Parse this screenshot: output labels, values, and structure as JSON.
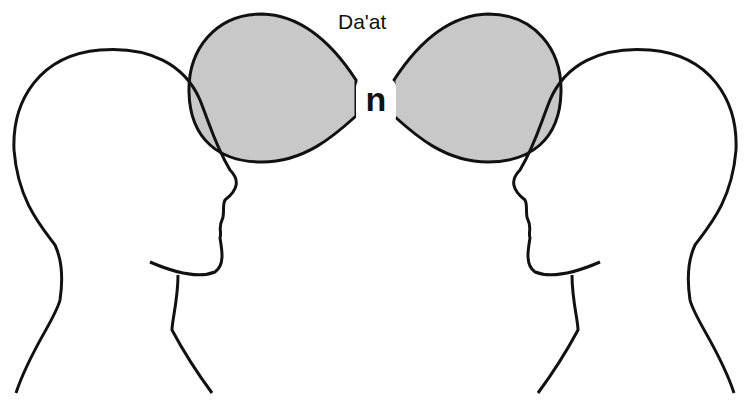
{
  "diagram": {
    "title": "Da'at",
    "center_glyph": "ח",
    "center_glyph_display": "n",
    "elements": [
      {
        "name": "left-head-profile",
        "facing": "right"
      },
      {
        "name": "right-head-profile",
        "facing": "left"
      },
      {
        "name": "left-lobe",
        "fill": "#c8c8c8"
      },
      {
        "name": "right-lobe",
        "fill": "#c8c8c8"
      }
    ],
    "colors": {
      "stroke": "#111111",
      "lobe_fill": "#c8c8c8",
      "background": "#ffffff"
    }
  }
}
